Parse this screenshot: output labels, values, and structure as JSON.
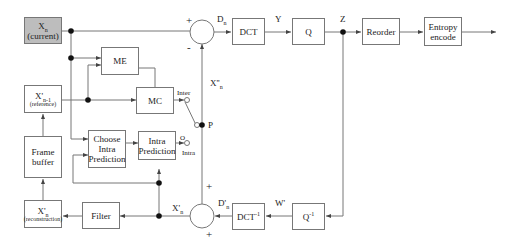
{
  "diagram": {
    "blocks": {
      "current": {
        "main": "X",
        "sub": "n",
        "caption": "(current)"
      },
      "reference": {
        "main": "X'",
        "sub": "n-1",
        "caption": "(reference)"
      },
      "frame_buffer": {
        "line1": "Frame",
        "line2": "buffer"
      },
      "reconstruction": {
        "main": "X'",
        "sub": "n",
        "caption": "(reconstruction)"
      },
      "me": {
        "label": "ME"
      },
      "mc": {
        "label": "MC"
      },
      "choose_intra": {
        "line1": "Choose",
        "line2": "Intra",
        "line3": "Prediction"
      },
      "intra_pred": {
        "line1": "Intra",
        "line2": "Prediction"
      },
      "filter": {
        "label": "Filter"
      },
      "dct": {
        "label": "DCT"
      },
      "q": {
        "label": "Q"
      },
      "reorder": {
        "label": "Reorder"
      },
      "entropy": {
        "line1": "Entropy",
        "line2": "encode"
      },
      "idct": {
        "label": "DCT",
        "sup": "-1"
      },
      "iq": {
        "label": "Q",
        "sup": "-1"
      }
    },
    "signals": {
      "dn": {
        "main": "D",
        "sub": "n"
      },
      "y": "Y",
      "z": "Z",
      "xn2": {
        "main": "X''",
        "sub": "n"
      },
      "p": "P",
      "inter": "Inter",
      "intra": "Intra",
      "o": "O",
      "dprime": {
        "main": "D'",
        "sub": "n"
      },
      "wprime": "W'",
      "xprime": {
        "main": "X'",
        "sub": "n"
      },
      "plus_top": "+",
      "minus_top": "-",
      "plus_bottom_top": "+",
      "plus_bottom_bottom": "+"
    },
    "colors": {
      "line": "#666666",
      "box_border": "#777777",
      "current_fill": "#bdbdbd"
    }
  }
}
